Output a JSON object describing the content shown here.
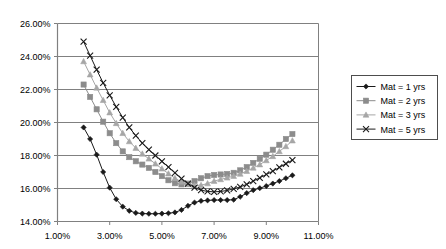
{
  "chart_data": {
    "type": "line",
    "title": "",
    "subtitle": "",
    "xlabel": "",
    "ylabel": "",
    "xlim": [
      1.0,
      11.0
    ],
    "ylim": [
      14.0,
      26.0
    ],
    "grid": "horizontal",
    "legend_position": "right",
    "x_tick_labels": [
      "1.00%",
      "3.00%",
      "5.00%",
      "7.00%",
      "9.00%",
      "11.00%"
    ],
    "x_ticks": [
      1.0,
      3.0,
      5.0,
      7.0,
      9.0,
      11.0
    ],
    "y_tick_labels": [
      "14.00%",
      "16.00%",
      "18.00%",
      "20.00%",
      "22.00%",
      "24.00%",
      "26.00%"
    ],
    "y_ticks": [
      14.0,
      16.0,
      18.0,
      20.0,
      22.0,
      24.0,
      26.0
    ],
    "x": [
      2.0,
      2.25,
      2.5,
      2.75,
      3.0,
      3.25,
      3.5,
      3.75,
      4.0,
      4.25,
      4.5,
      4.75,
      5.0,
      5.25,
      5.5,
      5.75,
      6.0,
      6.25,
      6.5,
      6.75,
      7.0,
      7.25,
      7.5,
      7.75,
      8.0,
      8.25,
      8.5,
      8.75,
      9.0,
      9.25,
      9.5,
      9.75,
      10.0
    ],
    "series": [
      {
        "name": "Mat = 1 yrs",
        "marker": "diamond",
        "color": "#1a1a1a",
        "values": [
          19.7,
          19.0,
          18.05,
          17.0,
          16.05,
          15.35,
          14.9,
          14.65,
          14.52,
          14.48,
          14.47,
          14.47,
          14.48,
          14.5,
          14.55,
          14.7,
          14.95,
          15.15,
          15.25,
          15.28,
          15.3,
          15.3,
          15.3,
          15.32,
          15.5,
          15.72,
          15.9,
          16.02,
          16.15,
          16.3,
          16.45,
          16.62,
          16.8
        ]
      },
      {
        "name": "Mat = 2 yrs",
        "marker": "square",
        "color": "#8c8c8c",
        "values": [
          22.3,
          21.55,
          20.8,
          20.05,
          19.35,
          18.75,
          18.25,
          17.9,
          17.65,
          17.45,
          17.25,
          17.0,
          16.75,
          16.5,
          16.32,
          16.25,
          16.3,
          16.45,
          16.62,
          16.75,
          16.82,
          16.85,
          16.88,
          16.95,
          17.1,
          17.3,
          17.55,
          17.8,
          18.05,
          18.35,
          18.65,
          19.0,
          19.3
        ]
      },
      {
        "name": "Mat = 3 yrs",
        "marker": "triangle",
        "color": "#a6a6a6",
        "values": [
          23.7,
          22.9,
          22.1,
          21.35,
          20.6,
          19.95,
          19.35,
          18.85,
          18.45,
          18.1,
          17.8,
          17.5,
          17.2,
          16.9,
          16.62,
          16.4,
          16.25,
          16.18,
          16.2,
          16.3,
          16.45,
          16.55,
          16.65,
          16.75,
          16.88,
          17.05,
          17.25,
          17.45,
          17.7,
          17.95,
          18.25,
          18.55,
          18.9
        ]
      },
      {
        "name": "Mat = 5 yrs",
        "marker": "cross",
        "color": "#1a1a1a",
        "values": [
          24.9,
          24.05,
          23.2,
          22.4,
          21.65,
          20.95,
          20.3,
          19.7,
          19.2,
          18.75,
          18.35,
          18.0,
          17.65,
          17.3,
          16.95,
          16.6,
          16.3,
          16.05,
          15.9,
          15.82,
          15.8,
          15.82,
          15.88,
          15.98,
          16.1,
          16.25,
          16.45,
          16.65,
          16.85,
          17.05,
          17.28,
          17.5,
          17.72
        ]
      }
    ]
  },
  "legend": {
    "entries": [
      {
        "label": "Mat = 1 yrs"
      },
      {
        "label": "Mat = 2 yrs"
      },
      {
        "label": "Mat = 3 yrs"
      },
      {
        "label": "Mat = 5 yrs"
      }
    ]
  }
}
